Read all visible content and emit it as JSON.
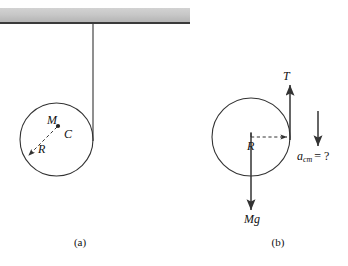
{
  "figure": {
    "panels": [
      {
        "id": "a",
        "caption": "(a)",
        "labels": {
          "mass": "M",
          "center": "C",
          "radius": "R"
        },
        "geometry": {
          "circle_cx": 56.5,
          "circle_cy": 139.5,
          "circle_r": 36.5,
          "center_dot_x": 58,
          "center_dot_y": 126,
          "string_x": 93,
          "string_top_y": 24,
          "string_bottom_y": 140,
          "radius_arrow_x2": 30,
          "radius_arrow_y2": 154
        }
      },
      {
        "id": "b",
        "caption": "(b)",
        "labels": {
          "tension": "T",
          "radius": "R",
          "weight": "Mg",
          "acceleration": "a",
          "acceleration_subscript": "cm",
          "acceleration_value": "= ?"
        },
        "geometry": {
          "circle_cx": 251,
          "circle_cy": 137,
          "circle_r": 39,
          "tension_x": 290,
          "tension_top_y": 86,
          "tension_bottom_y": 140,
          "radius_arrow_x1": 251,
          "radius_arrow_x2": 288,
          "radius_arrow_y": 137,
          "weight_x": 251,
          "weight_top_y": 137,
          "weight_bottom_y": 210,
          "accel_x": 318,
          "accel_top_y": 111,
          "accel_bottom_y": 146
        }
      }
    ],
    "ceiling": {
      "name": "ceiling-support",
      "x": 0,
      "y": 8,
      "width": 190,
      "height": 14
    },
    "colors": {
      "ceiling_fill": "#c8c8c8",
      "ceiling_edge": "#3a3a3a",
      "stroke": "#333333",
      "text": "#111111",
      "background": "#ffffff"
    }
  }
}
